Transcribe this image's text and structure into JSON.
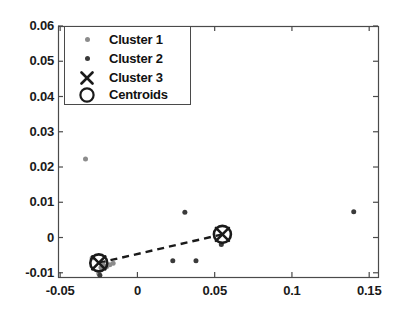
{
  "chart_data": {
    "type": "scatter",
    "title": "",
    "xlabel": "",
    "ylabel": "",
    "xlim": [
      -0.0514,
      0.1557
    ],
    "ylim": [
      -0.0112,
      0.06
    ],
    "grid": false,
    "legend_position": "upper left (inside axes)",
    "xticks": [
      "-0.05",
      "0",
      "0.05",
      "0.1",
      "0.15"
    ],
    "xtick_values": [
      -0.05,
      0,
      0.05,
      0.1,
      0.15
    ],
    "yticks": [
      "-0.01",
      "0",
      "0.01",
      "0.02",
      "0.03",
      "0.04",
      "0.05",
      "0.06"
    ],
    "ytick_values": [
      -0.01,
      0,
      0.01,
      0.02,
      0.03,
      0.04,
      0.05,
      0.06
    ],
    "series": [
      {
        "name": "Cluster 1",
        "marker": "dot",
        "color": "#8c8c8c",
        "size": 5,
        "points": [
          {
            "x": -0.0336,
            "y": 0.0223
          },
          {
            "x": -0.0293,
            "y": -0.0058
          },
          {
            "x": -0.0236,
            "y": -0.0085
          },
          {
            "x": -0.0221,
            "y": -0.0078
          },
          {
            "x": -0.02,
            "y": -0.0083
          },
          {
            "x": -0.0179,
            "y": -0.0077
          },
          {
            "x": -0.0157,
            "y": -0.0073
          },
          {
            "x": -0.025,
            "y": -0.0102
          }
        ]
      },
      {
        "name": "Cluster 2",
        "marker": "dot",
        "color": "#3a3a3a",
        "size": 5,
        "points": [
          {
            "x": 0.0307,
            "y": 0.0072
          },
          {
            "x": 0.0229,
            "y": -0.0066
          },
          {
            "x": 0.0379,
            "y": -0.0066
          },
          {
            "x": 0.0543,
            "y": -0.002
          },
          {
            "x": 0.14,
            "y": 0.0073
          },
          {
            "x": -0.0243,
            "y": -0.0107
          }
        ]
      },
      {
        "name": "Cluster 3",
        "marker": "x",
        "color": "#1a1a1a",
        "size": 13,
        "points": [
          {
            "x": -0.025,
            "y": -0.0072
          },
          {
            "x": 0.055,
            "y": 0.0009
          }
        ]
      },
      {
        "name": "Centroids",
        "marker": "circle",
        "color": "#1a1a1a",
        "size": 17,
        "points": [
          {
            "x": -0.025,
            "y": -0.0072
          },
          {
            "x": 0.055,
            "y": 0.0009
          }
        ]
      }
    ],
    "connector_line": {
      "style": "dashed",
      "color": "#1a1a1a",
      "from": {
        "x": -0.025,
        "y": -0.0072
      },
      "to": {
        "x": 0.055,
        "y": 0.0009
      }
    }
  },
  "legend": {
    "entries": [
      {
        "label": "Cluster 1",
        "marker": "small-gray-dot-icon"
      },
      {
        "label": "Cluster 2",
        "marker": "small-dark-dot-icon"
      },
      {
        "label": "Cluster 3",
        "marker": "x-cross-icon"
      },
      {
        "label": "Centroids",
        "marker": "open-circle-icon"
      }
    ]
  },
  "axes": {
    "x_labels": [
      "-0.05",
      "0",
      "0.05",
      "0.1",
      "0.15"
    ],
    "y_labels": [
      "0.06",
      "0.05",
      "0.04",
      "0.03",
      "0.02",
      "0.01",
      "0",
      "-0.01"
    ]
  },
  "colors": {
    "axis": "#4a4a4a",
    "cluster1": "#8c8c8c",
    "cluster2": "#3a3a3a",
    "marker": "#1a1a1a",
    "background": "#ffffff"
  }
}
